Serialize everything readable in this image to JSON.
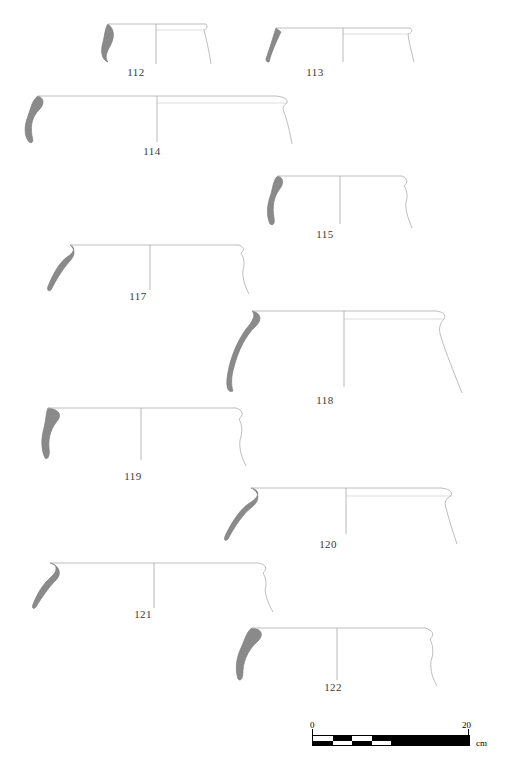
{
  "figure": {
    "type": "archaeological-pottery-profile-plate",
    "caption": "",
    "background_color": "#ffffff",
    "section_fill_color": "#8a8a8a",
    "outline_color": "#9a9a9a",
    "centerline_color": "#a8a8a8",
    "label_color": "#3a3a3a"
  },
  "vessels": [
    {
      "number": "112",
      "label": "112",
      "x": 98,
      "y": 20,
      "label_x": 136,
      "label_y": 66,
      "rim_width": 110,
      "height": 42,
      "description": "shallow open bowl with everted rim, thick section at left"
    },
    {
      "number": "113",
      "label": "113",
      "x": 262,
      "y": 22,
      "label_x": 315,
      "label_y": 66,
      "rim_width": 148,
      "height": 38,
      "description": "wide shallow dish, flaring rim, thin walls"
    },
    {
      "number": "114",
      "label": "114",
      "x": 18,
      "y": 92,
      "label_x": 152,
      "label_y": 145,
      "rim_width": 268,
      "height": 52,
      "description": "very wide shallow basin with thickened hooked rim"
    },
    {
      "number": "115",
      "label": "115",
      "x": 262,
      "y": 172,
      "label_x": 325,
      "label_y": 228,
      "rim_width": 148,
      "height": 54,
      "description": "deep bowl, slightly incurving wall"
    },
    {
      "number": "117",
      "label": "117",
      "x": 42,
      "y": 240,
      "label_x": 138,
      "label_y": 290,
      "rim_width": 205,
      "height": 50,
      "description": "wide bowl with sharply everted rim and flat base-less profile"
    },
    {
      "number": "118",
      "label": "118",
      "x": 222,
      "y": 305,
      "label_x": 325,
      "label_y": 394,
      "rim_width": 240,
      "height": 88,
      "description": "large deep jar/krater, thick rolled rim, strongly curving wall"
    },
    {
      "number": "119",
      "label": "119",
      "x": 36,
      "y": 402,
      "label_x": 133,
      "label_y": 470,
      "rim_width": 212,
      "height": 62,
      "description": "deep bowl with offset upper wall"
    },
    {
      "number": "120",
      "label": "120",
      "x": 215,
      "y": 482,
      "label_x": 328,
      "label_y": 538,
      "rim_width": 235,
      "height": 58,
      "description": "wide basin with hooked out-turned rim"
    },
    {
      "number": "121",
      "label": "121",
      "x": 28,
      "y": 558,
      "label_x": 143,
      "label_y": 608,
      "rim_width": 240,
      "height": 50,
      "description": "wide shallow basin with angular everted rim"
    },
    {
      "number": "122",
      "label": "122",
      "x": 230,
      "y": 622,
      "label_x": 333,
      "label_y": 681,
      "rim_width": 210,
      "height": 62,
      "description": "deep bowl with thickened rim and carinated lower wall"
    }
  ],
  "scale_bar": {
    "start_label": "0",
    "end_label": "20",
    "unit_label": "cm",
    "total_cm": 20,
    "segments_cm": 2.5,
    "x": 310,
    "y": 735,
    "width": 160,
    "height": 10
  }
}
